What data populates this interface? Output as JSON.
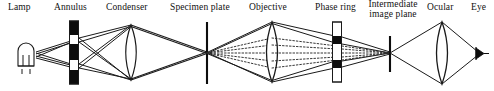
{
  "diagram": {
    "width": 494,
    "height": 91,
    "background": "#ffffff",
    "ink": "#000000",
    "ray_solid_color": "#1a1a1a",
    "ray_dotted_color": "#333333",
    "labels": [
      {
        "id": "lamp",
        "text": "Lamp",
        "x": 22,
        "y": 3,
        "two_line": false
      },
      {
        "id": "annulus",
        "text": "Annulus",
        "x": 74,
        "y": 3,
        "two_line": false
      },
      {
        "id": "condenser",
        "text": "Condenser",
        "x": 137,
        "y": 3,
        "two_line": false
      },
      {
        "id": "specimen-plate",
        "text": "Specimen plate",
        "x": 206,
        "y": 3,
        "two_line": false
      },
      {
        "id": "objective",
        "text": "Objective",
        "x": 271,
        "y": 3,
        "two_line": false
      },
      {
        "id": "phase-ring",
        "text": "Phase ring",
        "x": 338,
        "y": 3,
        "two_line": false
      },
      {
        "id": "intermediate-image",
        "text": "Intermediate image plane",
        "x": 393,
        "y": 1,
        "two_line": true
      },
      {
        "id": "ocular",
        "text": "Ocular",
        "x": 445,
        "y": 3,
        "two_line": false
      },
      {
        "id": "eye",
        "text": "Eye",
        "x": 481,
        "y": 3,
        "two_line": false
      }
    ],
    "components": {
      "lamp": {
        "name": "lamp-bulb",
        "x": 26,
        "cy": 56
      },
      "annulus": {
        "name": "annulus-stop",
        "x": 74,
        "top": 21,
        "bottom": 84,
        "width": 9,
        "segments": [
          {
            "fill": "black",
            "from": 21,
            "to": 35
          },
          {
            "fill": "white",
            "from": 35,
            "to": 44
          },
          {
            "fill": "black",
            "from": 44,
            "to": 60
          },
          {
            "fill": "white",
            "from": 60,
            "to": 70
          },
          {
            "fill": "black",
            "from": 70,
            "to": 84
          }
        ]
      },
      "condenser": {
        "name": "condenser-lens",
        "x": 131,
        "top": 25,
        "bottom": 80,
        "halfwidth": 10
      },
      "specimen": {
        "name": "specimen-plate",
        "x": 207,
        "top": 22,
        "bottom": 84
      },
      "objective": {
        "name": "objective-lens",
        "x": 272,
        "top": 22,
        "bottom": 82,
        "halfwidth": 11
      },
      "phasering": {
        "name": "phase-ring-plate",
        "x": 337,
        "top": 22,
        "bottom": 82,
        "width": 9,
        "segments": [
          {
            "fill": "white",
            "from": 22,
            "to": 36
          },
          {
            "fill": "black",
            "from": 36,
            "to": 44
          },
          {
            "fill": "white",
            "from": 44,
            "to": 60
          },
          {
            "fill": "black",
            "from": 60,
            "to": 68
          },
          {
            "fill": "white",
            "from": 68,
            "to": 82
          }
        ]
      },
      "intermediate": {
        "name": "intermediate-image-plane",
        "x": 390,
        "top": 36,
        "bottom": 72
      },
      "ocular": {
        "name": "ocular-lens",
        "x": 442,
        "top": 22,
        "bottom": 84,
        "halfwidth": 11
      },
      "eye": {
        "name": "eye-marker",
        "x": 480,
        "cy": 53
      }
    },
    "optical_axis_y": 53
  }
}
